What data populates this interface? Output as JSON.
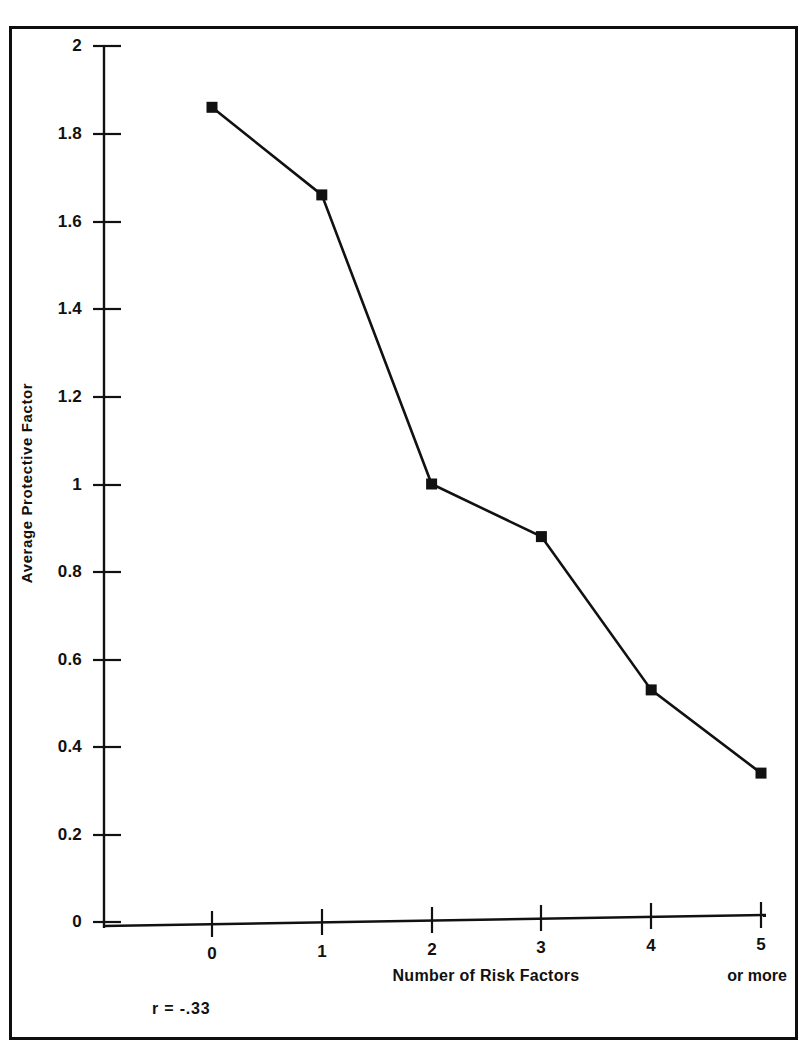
{
  "figure": {
    "background_color": "#ffffff",
    "frame_color": "#0e0e0e",
    "ink_color": "#111111"
  },
  "chart_data": {
    "type": "line",
    "title": "",
    "xlabel": "Number of Risk Factors",
    "ylabel": "Average Protective Factor",
    "x_suffix_note": "or more",
    "categories": [
      "0",
      "1",
      "2",
      "3",
      "4",
      "5"
    ],
    "x": [
      0,
      1,
      2,
      3,
      4,
      5
    ],
    "values": [
      1.86,
      1.66,
      1.0,
      0.88,
      0.53,
      0.34
    ],
    "series": [
      {
        "name": "Average Protective Factor",
        "values": [
          1.86,
          1.66,
          1.0,
          0.88,
          0.53,
          0.34
        ]
      }
    ],
    "ylim": [
      0,
      2
    ],
    "xlim": [
      -0.4,
      5.4
    ],
    "ytick_labels": [
      "2",
      "1.8",
      "1.6",
      "1.4",
      "1.2",
      "1",
      "0.8",
      "0.6",
      "0.4",
      "0.2",
      "0"
    ],
    "ytick_values": [
      2,
      1.8,
      1.6,
      1.4,
      1.2,
      1,
      0.8,
      0.6,
      0.4,
      0.2,
      0
    ],
    "xtick_labels": [
      "0",
      "1",
      "2",
      "3",
      "4",
      "5"
    ],
    "grid": false,
    "legend": false,
    "legend_position": "none",
    "marker": "filled-square",
    "line_color": "#111111",
    "marker_color": "#111111",
    "annotations": [
      {
        "name": "correlation",
        "text": "r = -.33"
      }
    ]
  }
}
